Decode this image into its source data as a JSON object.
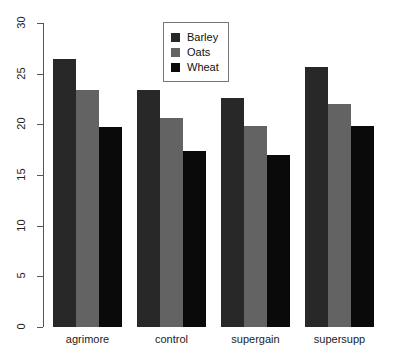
{
  "chart_data": {
    "type": "bar",
    "title": "",
    "subtitle": "",
    "xlabel": "",
    "ylabel": "",
    "categories": [
      "agrimore",
      "control",
      "supergain",
      "supersupp"
    ],
    "series": [
      {
        "name": "Barley",
        "color": "#282828",
        "values": [
          26.4,
          23.4,
          22.6,
          25.7
        ]
      },
      {
        "name": "Oats",
        "color": "#636363",
        "values": [
          23.4,
          20.6,
          19.8,
          22.0
        ]
      },
      {
        "name": "Wheat",
        "color": "#0a0a0a",
        "values": [
          19.7,
          17.4,
          17.0,
          19.8
        ]
      }
    ],
    "ylim": [
      0,
      30
    ],
    "yticks": [
      0,
      5,
      10,
      15,
      20,
      25,
      30
    ],
    "ytick_labels": [
      "0",
      "5",
      "10",
      "15",
      "20",
      "25",
      "30"
    ],
    "grid": false,
    "grouping": "grouped",
    "legend": {
      "position": "top-center",
      "border": true,
      "entries": [
        "Barley",
        "Oats",
        "Wheat"
      ]
    },
    "axis_color": "#555555",
    "background": "#ffffff"
  }
}
